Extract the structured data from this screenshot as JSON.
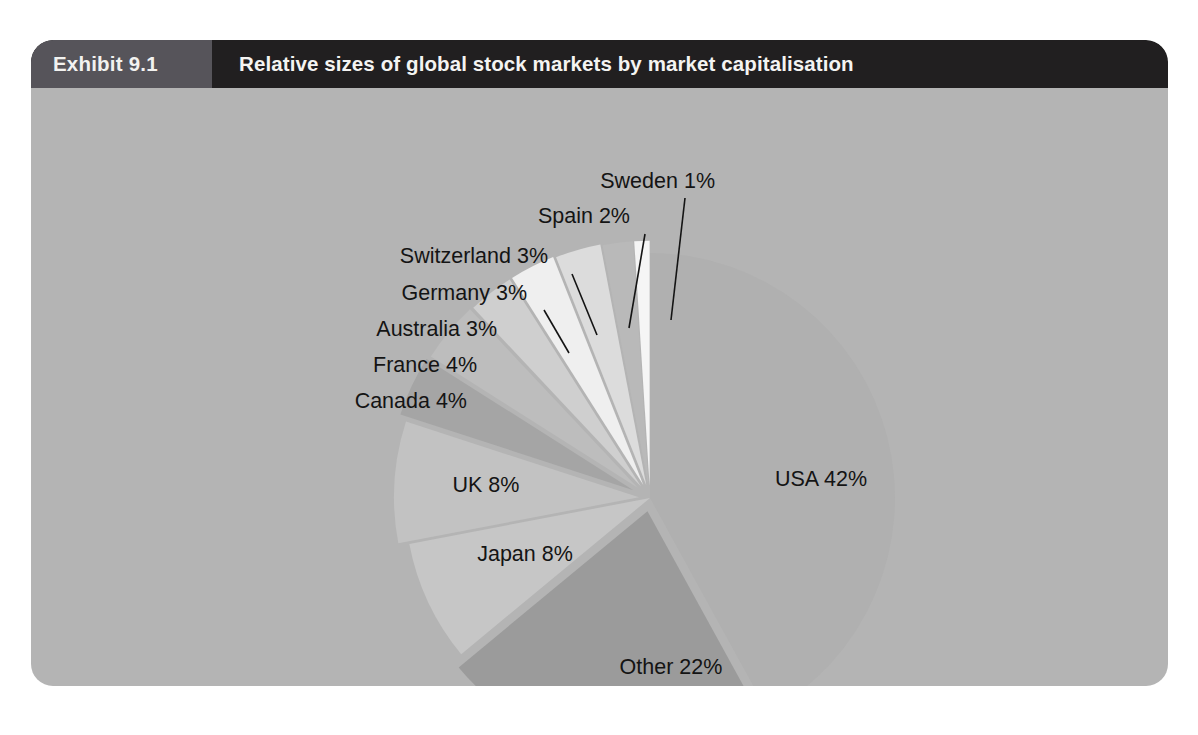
{
  "exhibit": {
    "number": "Exhibit 9.1",
    "title": "Relative sizes of global stock markets by market capitalisation",
    "header_bg": "#211f20",
    "number_bg": "#56545a",
    "panel_bg": "#b4b4b4"
  },
  "chart_data": {
    "type": "pie",
    "title": "Relative sizes of global stock markets by market capitalisation",
    "unit": "%",
    "total": 100,
    "legend_position": "callout-labels",
    "grid": false,
    "categories": [
      "USA",
      "Other",
      "Japan",
      "UK",
      "Canada",
      "France",
      "Australia",
      "Germany",
      "Switzerland",
      "Spain",
      "Sweden"
    ],
    "values": [
      42,
      22,
      8,
      8,
      4,
      4,
      3,
      3,
      3,
      2,
      1
    ],
    "labels": [
      "USA 42%",
      "Other 22%",
      "Japan 8%",
      "UK 8%",
      "Canada 4%",
      "France 4%",
      "Australia 3%",
      "Germany 3%",
      "Switzerland 3%",
      "Spain 2%",
      "Sweden 1%"
    ],
    "colors": [
      "#b0b0b0",
      "#9b9b9b",
      "#c6c6c6",
      "#c2c2c2",
      "#a5a5a5",
      "#bdbdbd",
      "#cfcfcf",
      "#efefef",
      "#dcdcdc",
      "#b9b9b9",
      "#f5f5f5"
    ],
    "explode": [
      0,
      0.055,
      0,
      0.045,
      0.075,
      0.065,
      0.06,
      0.06,
      0.055,
      0.05,
      0.05
    ],
    "start_angle_deg": 0,
    "direction": "clockwise"
  },
  "geometry": {
    "center_x": 619,
    "center_y": 410,
    "radius": 245,
    "labels": [
      {
        "key": "USA",
        "text": "USA 42%",
        "x": 790,
        "y": 398,
        "anchor": "middle",
        "leader": null
      },
      {
        "key": "Other",
        "text": "Other 22%",
        "x": 640,
        "y": 586,
        "anchor": "middle",
        "leader": null
      },
      {
        "key": "Japan",
        "text": "Japan 8%",
        "x": 494,
        "y": 473,
        "anchor": "middle",
        "leader": null
      },
      {
        "key": "UK",
        "text": "UK 8%",
        "x": 455,
        "y": 404,
        "anchor": "middle",
        "leader": null
      },
      {
        "key": "Canada",
        "text": "Canada 4%",
        "x": 436,
        "y": 320,
        "anchor": "end",
        "leader": null
      },
      {
        "key": "France",
        "text": "France 4%",
        "x": 446,
        "y": 284,
        "anchor": "end",
        "leader": null
      },
      {
        "key": "Australia",
        "text": "Australia 3%",
        "x": 466,
        "y": 248,
        "anchor": "end",
        "leader": null
      },
      {
        "key": "Germany",
        "text": "Germany 3%",
        "x": 496,
        "y": 212,
        "anchor": "end",
        "leader": {
          "x1": 513,
          "y1": 222,
          "x2": 538,
          "y2": 265
        }
      },
      {
        "key": "Switzerland",
        "text": "Switzerland 3%",
        "x": 517,
        "y": 175,
        "anchor": "end",
        "leader": {
          "x1": 541,
          "y1": 186,
          "x2": 566,
          "y2": 247
        }
      },
      {
        "key": "Spain",
        "text": "Spain 2%",
        "x": 599,
        "y": 135,
        "anchor": "end",
        "leader": {
          "x1": 614,
          "y1": 146,
          "x2": 598,
          "y2": 240
        }
      },
      {
        "key": "Sweden",
        "text": "Sweden 1%",
        "x": 684,
        "y": 100,
        "anchor": "end",
        "leader": {
          "x1": 654,
          "y1": 110,
          "x2": 640,
          "y2": 232
        }
      }
    ]
  }
}
